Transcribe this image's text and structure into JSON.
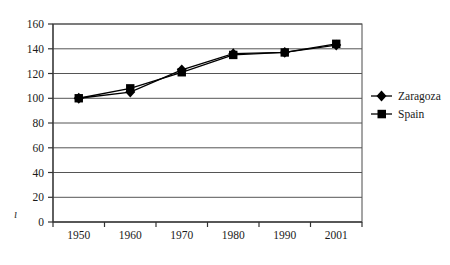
{
  "chart_data": {
    "type": "line",
    "title": "",
    "xlabel": "",
    "ylabel": "",
    "categories": [
      "1950",
      "1960",
      "1970",
      "1980",
      "1990",
      "2001"
    ],
    "x_values": [
      1950,
      1960,
      1970,
      1980,
      1990,
      2001
    ],
    "series": [
      {
        "name": "Zaragoza",
        "marker": "diamond",
        "color": "#000000",
        "values": [
          100,
          105,
          123,
          136,
          137,
          143
        ]
      },
      {
        "name": "Spain",
        "marker": "square",
        "color": "#000000",
        "values": [
          100,
          108,
          121,
          135,
          137,
          144
        ]
      }
    ],
    "ylim": [
      0,
      160
    ],
    "yticks": [
      0,
      20,
      40,
      60,
      80,
      100,
      120,
      140,
      160
    ],
    "ytick_labels": [
      "0",
      "20",
      "40",
      "60",
      "80",
      "100",
      "120",
      "140",
      "160"
    ],
    "xtick_labels": [
      "1950",
      "1960",
      "1970",
      "1980",
      "1990",
      "2001"
    ],
    "grid": "horizontal",
    "legend_position": "right",
    "plot_border": true,
    "background_color": "#ffffff",
    "gridline_color": "#555555",
    "axis_color": "#333333"
  },
  "legend": {
    "entries": [
      {
        "label": "Zaragoza",
        "marker": "diamond-icon"
      },
      {
        "label": "Spain",
        "marker": "square-icon"
      }
    ]
  },
  "yaxis": {
    "labels": [
      "160",
      "140",
      "120",
      "100",
      "80",
      "60",
      "40",
      "20",
      "0"
    ]
  },
  "xaxis": {
    "labels": [
      "1950",
      "1960",
      "1970",
      "1980",
      "1990",
      "2001"
    ]
  },
  "artifacts": {
    "stray_mark": "ı"
  }
}
